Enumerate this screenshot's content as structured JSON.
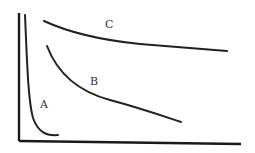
{
  "diagram": {
    "axes": {
      "color": "#1a1a1a",
      "x_label": "",
      "y_label": ""
    },
    "curves": [
      {
        "id": "A",
        "label": "A",
        "shape": "steep hyperbolic decay near y-axis"
      },
      {
        "id": "B",
        "label": "B",
        "shape": "moderate decay"
      },
      {
        "id": "C",
        "label": "C",
        "shape": "shallow decay, highest curve"
      }
    ]
  }
}
